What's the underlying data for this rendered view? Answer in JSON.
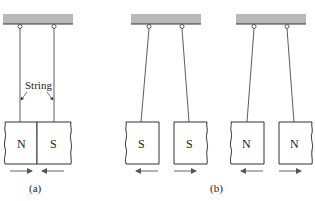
{
  "figure": {
    "panel_a": {
      "caption": "(a)",
      "string_label": "String",
      "magnets": [
        {
          "pole": "N",
          "force": "right"
        },
        {
          "pole": "S",
          "force": "left"
        }
      ],
      "description": "Opposite poles attract"
    },
    "panel_b": {
      "caption": "(b)",
      "pairs": [
        {
          "magnets": [
            {
              "pole": "S",
              "force": "left"
            },
            {
              "pole": "S",
              "force": "right"
            }
          ]
        },
        {
          "magnets": [
            {
              "pole": "N",
              "force": "left"
            },
            {
              "pole": "N",
              "force": "right"
            }
          ]
        }
      ],
      "description": "Like poles repel"
    }
  },
  "colors": {
    "support": "#b8b8b8",
    "support_edge": "#333333",
    "line": "#333333",
    "arrow": "#666666"
  }
}
